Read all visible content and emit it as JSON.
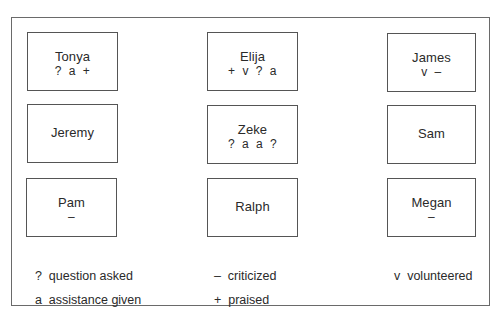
{
  "seats": [
    {
      "name": "Tonya",
      "marks": "? a +"
    },
    {
      "name": "Elija",
      "marks": "+ v ? a"
    },
    {
      "name": "James",
      "marks": "v –"
    },
    {
      "name": "Jeremy",
      "marks": ""
    },
    {
      "name": "Zeke",
      "marks": "? a a ?"
    },
    {
      "name": "Sam",
      "marks": ""
    },
    {
      "name": "Pam",
      "marks": "–"
    },
    {
      "name": "Ralph",
      "marks": ""
    },
    {
      "name": "Megan",
      "marks": "–"
    }
  ],
  "legend": [
    {
      "symbol": "?",
      "label": "question asked"
    },
    {
      "symbol": "–",
      "label": "criticized"
    },
    {
      "symbol": "v",
      "label": "volunteered"
    },
    {
      "symbol": "a",
      "label": "assistance given"
    },
    {
      "symbol": "+",
      "label": "praised"
    }
  ]
}
